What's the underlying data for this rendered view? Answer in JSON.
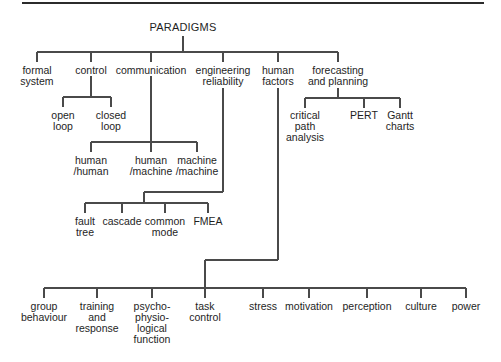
{
  "diagram": {
    "type": "tree",
    "root": "PARADIGMS",
    "branches": {
      "formal_system": {
        "label": "formal\nsystem"
      },
      "control": {
        "label": "control",
        "children": [
          "open\nloop",
          "closed\nloop"
        ]
      },
      "communication": {
        "label": "communication",
        "children": [
          "human\n/human",
          "human\n/machine",
          "machine\n/machine"
        ]
      },
      "engineering_reliability": {
        "label": "engineering\nreliability",
        "children": [
          "fault\ntree",
          "cascade",
          "common\nmode",
          "FMEA"
        ]
      },
      "human_factors": {
        "label": "human\nfactors",
        "children": [
          "group\nbehaviour",
          "training\nand\nresponse",
          "psycho-\nphysio-\nlogical\nfunction",
          "task\ncontrol",
          "stress",
          "motivation",
          "perception",
          "culture",
          "power"
        ]
      },
      "forecasting_planning": {
        "label": "forecasting\nand planning",
        "children": [
          "critical\npath\nanalysis",
          "PERT",
          "Gantt\ncharts"
        ]
      }
    },
    "colors": {
      "line": "#4a4a4a",
      "text": "#1e1e1e",
      "rule": "#2b2b2b",
      "background": "#ffffff"
    }
  }
}
